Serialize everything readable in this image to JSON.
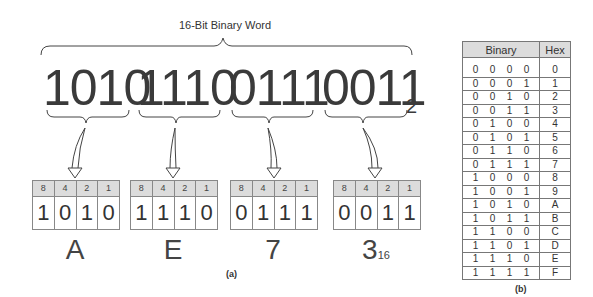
{
  "panel_a": {
    "title": "16-Bit Binary Word",
    "binary_word": "1010111001110011",
    "groups": [
      {
        "digits": "1010",
        "weights": [
          "8",
          "4",
          "2",
          "1"
        ],
        "bits": [
          "1",
          "0",
          "1",
          "0"
        ],
        "hex": "A"
      },
      {
        "digits": "1110",
        "weights": [
          "8",
          "4",
          "2",
          "1"
        ],
        "bits": [
          "1",
          "1",
          "1",
          "0"
        ],
        "hex": "E"
      },
      {
        "digits": "0111",
        "weights": [
          "8",
          "4",
          "2",
          "1"
        ],
        "bits": [
          "0",
          "1",
          "1",
          "1"
        ],
        "hex": "7"
      },
      {
        "digits": "0011",
        "weights": [
          "8",
          "4",
          "2",
          "1"
        ],
        "bits": [
          "0",
          "0",
          "1",
          "1"
        ],
        "hex": "3"
      }
    ],
    "binary_base": "2",
    "hex_base": "16",
    "caption": "(a)"
  },
  "panel_b": {
    "headers": {
      "binary": "Binary",
      "hex": "Hex"
    },
    "rows": [
      {
        "bits": [
          "0",
          "0",
          "0",
          "0"
        ],
        "hex": "0"
      },
      {
        "bits": [
          "0",
          "0",
          "0",
          "1"
        ],
        "hex": "1"
      },
      {
        "bits": [
          "0",
          "0",
          "1",
          "0"
        ],
        "hex": "2"
      },
      {
        "bits": [
          "0",
          "0",
          "1",
          "1"
        ],
        "hex": "3"
      },
      {
        "bits": [
          "0",
          "1",
          "0",
          "0"
        ],
        "hex": "4"
      },
      {
        "bits": [
          "0",
          "1",
          "0",
          "1"
        ],
        "hex": "5"
      },
      {
        "bits": [
          "0",
          "1",
          "1",
          "0"
        ],
        "hex": "6"
      },
      {
        "bits": [
          "0",
          "1",
          "1",
          "1"
        ],
        "hex": "7"
      },
      {
        "bits": [
          "1",
          "0",
          "0",
          "0"
        ],
        "hex": "8"
      },
      {
        "bits": [
          "1",
          "0",
          "0",
          "1"
        ],
        "hex": "9"
      },
      {
        "bits": [
          "1",
          "0",
          "1",
          "0"
        ],
        "hex": "A"
      },
      {
        "bits": [
          "1",
          "0",
          "1",
          "1"
        ],
        "hex": "B"
      },
      {
        "bits": [
          "1",
          "1",
          "0",
          "0"
        ],
        "hex": "C"
      },
      {
        "bits": [
          "1",
          "1",
          "0",
          "1"
        ],
        "hex": "D"
      },
      {
        "bits": [
          "1",
          "1",
          "1",
          "0"
        ],
        "hex": "E"
      },
      {
        "bits": [
          "1",
          "1",
          "1",
          "1"
        ],
        "hex": "F"
      }
    ],
    "caption": "(b)"
  },
  "colors": {
    "header_fill": "#dcdcdc",
    "line": "#777777",
    "text": "#333333"
  }
}
